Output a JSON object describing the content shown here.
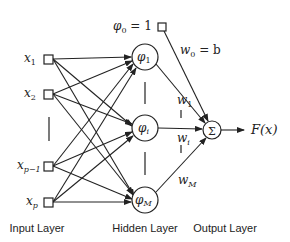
{
  "diagram": {
    "type": "neural-network (RBF)",
    "layers": {
      "input": {
        "label": "Input Layer",
        "nodes": [
          {
            "label_base": "x",
            "label_sub": "1"
          },
          {
            "label_base": "x",
            "label_sub": "2"
          },
          {
            "label_base": "x",
            "label_sub": "p−1"
          },
          {
            "label_base": "x",
            "label_sub": "p"
          }
        ]
      },
      "hidden": {
        "label": "Hidden Layer",
        "nodes": [
          {
            "label_base": "φ",
            "label_sub": "1"
          },
          {
            "label_base": "φ",
            "label_sub": "i"
          },
          {
            "label_base": "φ",
            "label_sub": "M"
          }
        ]
      },
      "output": {
        "label": "Output Layer",
        "node_symbol": "Σ",
        "output_label": "F(x)"
      }
    },
    "bias": {
      "label_base": "φ",
      "label_sub": "0",
      "label_rest": " = 1",
      "weight_base": "w",
      "weight_sub": "0",
      "weight_rest": " = b"
    },
    "weights": [
      {
        "base": "w",
        "sub": "1"
      },
      {
        "base": "w",
        "sub": "i"
      },
      {
        "base": "w",
        "sub": "M"
      }
    ],
    "colors": {
      "stroke": "#222222",
      "background": "#ffffff"
    }
  }
}
